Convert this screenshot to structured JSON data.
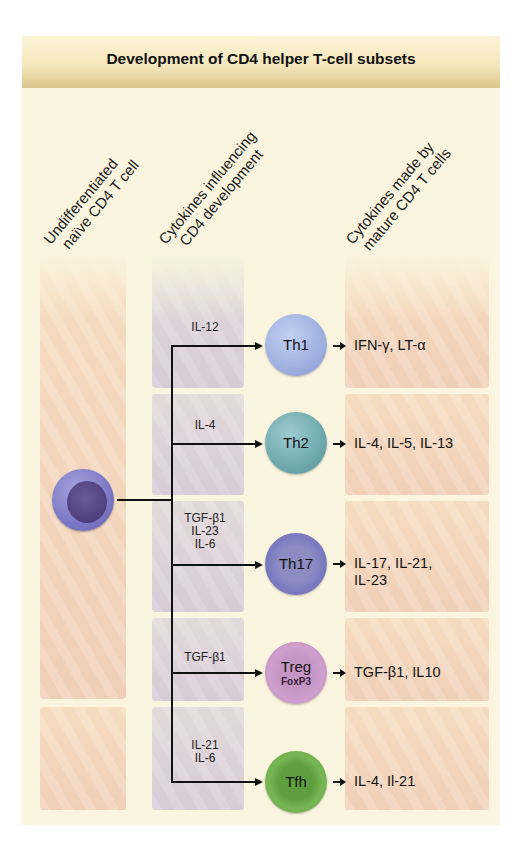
{
  "title": "Development of CD4 helper T-cell subsets",
  "column_headers": [
    {
      "line1": "Undifferentiated",
      "line2": "naïve CD4 T cell"
    },
    {
      "line1": "Cytokines influencing",
      "line2": "CD4 development"
    },
    {
      "line1": "Cytokines made by",
      "line2": "mature CD4 T cells"
    }
  ],
  "naive_cell": {
    "label": "",
    "color": "#7c78c5"
  },
  "subsets": [
    {
      "name": "Th1",
      "marker": "",
      "inducing_cytokines": [
        "IL-12"
      ],
      "output_cytokines": [
        "IFN-γ, LT-α"
      ],
      "color": "#9fb0e0"
    },
    {
      "name": "Th2",
      "marker": "",
      "inducing_cytokines": [
        "IL-4"
      ],
      "output_cytokines": [
        "IL-4, IL-5, IL-13"
      ],
      "color": "#6fa9ae"
    },
    {
      "name": "Th17",
      "marker": "",
      "inducing_cytokines": [
        "TGF-β1",
        "IL-23",
        "IL-6"
      ],
      "output_cytokines": [
        "IL-17, IL-21,",
        "IL-23"
      ],
      "color": "#7b7dc0"
    },
    {
      "name": "Treg",
      "marker": "FoxP3",
      "inducing_cytokines": [
        "TGF-β1"
      ],
      "output_cytokines": [
        "TGF-β1, IL10"
      ],
      "color": "#c88fc2"
    },
    {
      "name": "Tfh",
      "marker": "",
      "inducing_cytokines": [
        "IL-21",
        "IL-6"
      ],
      "output_cytokines": [
        "IL-4, Il-21"
      ],
      "color": "#6cae4a"
    }
  ]
}
